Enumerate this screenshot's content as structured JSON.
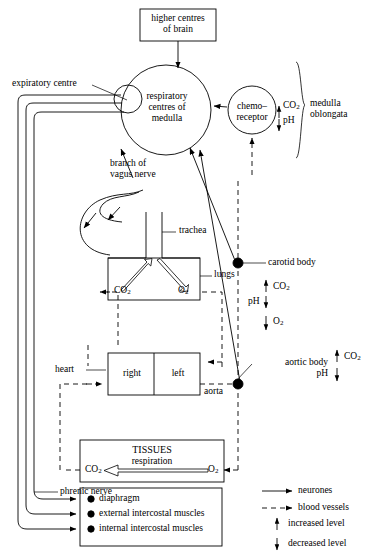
{
  "diagram": {
    "title_nodes": {
      "higher_centres": "higher centres\nof brain",
      "respiratory_centres": "respiratory\ncentres of\nmedulla",
      "chemoreceptor": "chemo–\nreceptor",
      "medulla_oblongata": "medulla\noblongata",
      "expiratory_centre": "expiratory centre",
      "branch_vagus": "branch of\nvagus nerve",
      "trachea": "trachea",
      "lungs": "lungs",
      "carotid_body": "carotid body",
      "aortic_body": "aortic body",
      "heart": "heart",
      "heart_right": "right",
      "heart_left": "left",
      "aorta": "aorta",
      "tissues": "TISSUES",
      "respiration": "respiration",
      "phrenic_nerve": "phrenic nerve"
    },
    "gas_labels": {
      "co2": "CO",
      "o2": "O",
      "ph": "pH",
      "sub2": "2"
    },
    "chemoreceptor_levels": {
      "co2_text": "CO",
      "ph_text": "pH"
    },
    "lungs_exchange": {
      "co2_out": "CO",
      "o2_in": "O"
    },
    "tissue_exchange": {
      "co2_out": "CO",
      "o2_in": "O"
    },
    "carotid_levels": {
      "co2": "CO",
      "ph": "pH",
      "o2": "O"
    },
    "aortic_levels": {
      "co2": "CO",
      "ph": "pH"
    },
    "effectors": [
      {
        "label": "diaphragm"
      },
      {
        "label": "external intercostal muscles"
      },
      {
        "label": "internal intercostal muscles"
      }
    ],
    "legend": [
      {
        "key": "neurones",
        "label": "neurones",
        "style": "solid-arrow"
      },
      {
        "key": "blood-vessels",
        "label": "blood vessels",
        "style": "dashed-arrow"
      },
      {
        "key": "increased-level",
        "label": "increased level",
        "style": "up-arrow"
      },
      {
        "key": "decreased-level",
        "label": "decreased level",
        "style": "down-arrow"
      }
    ],
    "colors": {
      "ink": "#000000",
      "paper": "#ffffff"
    }
  }
}
